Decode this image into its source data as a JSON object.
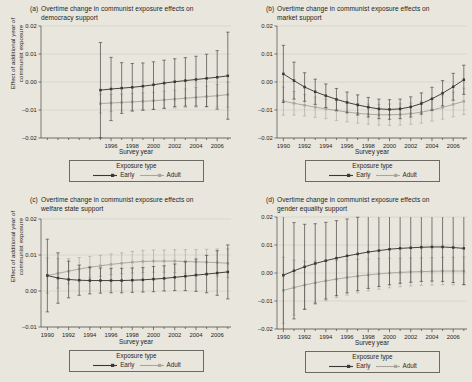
{
  "figure": {
    "background_color": "#e9e6dd",
    "series_colors": {
      "early": "#3a3834",
      "adult": "#a8a59c"
    },
    "axis_labels": {
      "x": "Survey year",
      "y_line1": "Effect of additional year of",
      "y_line2": "communist exposure"
    },
    "legend": {
      "title": "Exposure type",
      "entries": [
        {
          "label": "Early",
          "color": "#3a3834"
        },
        {
          "label": "Adult",
          "color": "#a8a59c"
        }
      ]
    }
  },
  "chart_data": [
    {
      "type": "line",
      "panel": "a",
      "panel_label": "(a)",
      "title_line1": "Overtime change in communist exposure effects on",
      "title_line2": "democracy support",
      "xlabel": "Survey year",
      "ylabel": "Effect of additional year of communist exposure",
      "xlim": [
        1989.4,
        2007.3
      ],
      "ylim": [
        -0.02,
        0.02
      ],
      "yticks": [
        0.02,
        0.01,
        0.0,
        -0.01,
        -0.02
      ],
      "yticklabels": [
        "0.02",
        "0.01",
        "0.00",
        "-0.01",
        "-0.02"
      ],
      "xticks": [
        1990,
        1991,
        1992,
        1993,
        1994,
        1995,
        1996,
        1997,
        1998,
        1999,
        2000,
        2001,
        2002,
        2003,
        2004,
        2005,
        2006,
        2007
      ],
      "xticklabels_major": [
        1996,
        1998,
        2000,
        2002,
        2004,
        2006
      ],
      "grid": "horizontal",
      "x": [
        1995,
        1996,
        1997,
        1998,
        1999,
        2000,
        2001,
        2002,
        2003,
        2004,
        2005,
        2006,
        2007
      ],
      "series": [
        {
          "name": "Early",
          "color": "#3a3834",
          "values": [
            -0.0029,
            -0.0025,
            -0.0022,
            -0.0019,
            -0.0015,
            -0.001,
            -0.0004,
            0.0001,
            0.0005,
            0.0009,
            0.0013,
            0.0017,
            0.0022
          ],
          "ci_low": [
            -0.0199,
            -0.0138,
            -0.0112,
            -0.0104,
            -0.0101,
            -0.0098,
            -0.0094,
            -0.0088,
            -0.0086,
            -0.0086,
            -0.0088,
            -0.0097,
            -0.0133
          ],
          "ci_high": [
            0.0141,
            0.0088,
            0.0069,
            0.0066,
            0.0068,
            0.0072,
            0.0078,
            0.0083,
            0.0087,
            0.0092,
            0.0099,
            0.0112,
            0.0178
          ]
        },
        {
          "name": "Adult",
          "color": "#a8a59c",
          "values": [
            -0.0077,
            -0.0075,
            -0.0073,
            -0.0071,
            -0.0069,
            -0.0067,
            -0.0064,
            -0.0061,
            -0.0058,
            -0.0055,
            -0.0052,
            -0.0049,
            -0.0045
          ],
          "ci_low": [
            -0.0111,
            -0.0106,
            -0.0103,
            -0.0101,
            -0.0099,
            -0.0097,
            -0.0095,
            -0.0093,
            -0.0091,
            -0.009,
            -0.0089,
            -0.0089,
            -0.009
          ],
          "ci_high": [
            -0.0043,
            -0.0044,
            -0.0043,
            -0.0041,
            -0.0039,
            -0.0037,
            -0.0033,
            -0.0029,
            -0.0025,
            -0.002,
            -0.0015,
            -0.0009,
            0.0
          ]
        }
      ]
    },
    {
      "type": "line",
      "panel": "b",
      "panel_label": "(b)",
      "title_line1": "Overtime change in communist exposure effects on",
      "title_line2": "market support",
      "xlabel": "Survey year",
      "ylabel": "Effect of additional year of communist exposure",
      "xlim": [
        1989.4,
        2007.3
      ],
      "ylim": [
        -0.02,
        0.02
      ],
      "yticks": [
        0.02,
        0.01,
        0.0,
        -0.01,
        -0.02
      ],
      "yticklabels": [
        "0.02",
        "0.01",
        "0.00",
        "-0.01",
        "-0.02"
      ],
      "xticks": [
        1990,
        1991,
        1992,
        1993,
        1994,
        1995,
        1996,
        1997,
        1998,
        1999,
        2000,
        2001,
        2002,
        2003,
        2004,
        2005,
        2006,
        2007
      ],
      "xticklabels_major": [
        1990,
        1992,
        1994,
        1996,
        1998,
        2000,
        2002,
        2004,
        2006
      ],
      "grid": "horizontal",
      "x": [
        1990,
        1991,
        1992,
        1993,
        1994,
        1995,
        1996,
        1997,
        1998,
        1999,
        2000,
        2001,
        2002,
        2003,
        2004,
        2005,
        2006,
        2007
      ],
      "series": [
        {
          "name": "Early",
          "color": "#3a3834",
          "values": [
            0.0029,
            0.0005,
            -0.0018,
            -0.0035,
            -0.0049,
            -0.0062,
            -0.0073,
            -0.0082,
            -0.009,
            -0.0096,
            -0.0098,
            -0.0096,
            -0.0089,
            -0.0077,
            -0.006,
            -0.004,
            -0.0017,
            0.0008
          ],
          "ci_low": [
            -0.0073,
            -0.0061,
            -0.0069,
            -0.008,
            -0.0091,
            -0.0101,
            -0.011,
            -0.0118,
            -0.0125,
            -0.0131,
            -0.0133,
            -0.0131,
            -0.0125,
            -0.0115,
            -0.0101,
            -0.0085,
            -0.0065,
            -0.0044
          ],
          "ci_high": [
            0.0131,
            0.0071,
            0.0033,
            0.001,
            -0.0007,
            -0.0023,
            -0.0036,
            -0.0046,
            -0.0055,
            -0.0061,
            -0.0063,
            -0.0061,
            -0.0053,
            -0.0039,
            -0.0019,
            0.0005,
            0.0031,
            0.006
          ]
        },
        {
          "name": "Adult",
          "color": "#a8a59c",
          "values": [
            -0.0068,
            -0.0076,
            -0.0083,
            -0.009,
            -0.0096,
            -0.0102,
            -0.0107,
            -0.0112,
            -0.0115,
            -0.0117,
            -0.0117,
            -0.0116,
            -0.0113,
            -0.0108,
            -0.01,
            -0.0091,
            -0.008,
            -0.0069
          ],
          "ci_low": [
            -0.0118,
            -0.0118,
            -0.0121,
            -0.0126,
            -0.0131,
            -0.0137,
            -0.0142,
            -0.0147,
            -0.0151,
            -0.0154,
            -0.0155,
            -0.0154,
            -0.0151,
            -0.0147,
            -0.014,
            -0.0133,
            -0.0124,
            -0.0116
          ],
          "ci_high": [
            -0.0018,
            -0.0034,
            -0.0045,
            -0.0054,
            -0.0061,
            -0.0067,
            -0.0072,
            -0.0077,
            -0.0079,
            -0.008,
            -0.0079,
            -0.0078,
            -0.0075,
            -0.0069,
            -0.006,
            -0.0049,
            -0.0036,
            -0.0022
          ]
        }
      ]
    },
    {
      "type": "line",
      "panel": "c",
      "panel_label": "(c)",
      "title_line1": "Overtime change in communist exposure effects on",
      "title_line2": "welfare state support",
      "xlabel": "Survey year",
      "ylabel": "Effect of additional year of communist exposure",
      "xlim": [
        1989.4,
        2007.3
      ],
      "ylim": [
        -0.01,
        0.02
      ],
      "yticks": [
        0.02,
        0.01,
        0.0,
        -0.01
      ],
      "yticklabels": [
        "0.02",
        "0.01",
        "0.00",
        "-0.01"
      ],
      "xticks": [
        1990,
        1991,
        1992,
        1993,
        1994,
        1995,
        1996,
        1997,
        1998,
        1999,
        2000,
        2001,
        2002,
        2003,
        2004,
        2005,
        2006,
        2007
      ],
      "xticklabels_major": [
        1990,
        1992,
        1994,
        1996,
        1998,
        2000,
        2002,
        2004,
        2006
      ],
      "grid": "horizontal",
      "x": [
        1990,
        1991,
        1992,
        1993,
        1994,
        1995,
        1996,
        1997,
        1998,
        1999,
        2000,
        2001,
        2002,
        2003,
        2004,
        2005,
        2006,
        2007
      ],
      "series": [
        {
          "name": "Early",
          "color": "#3a3834",
          "values": [
            0.0043,
            0.0036,
            0.0032,
            0.003,
            0.0029,
            0.0029,
            0.0029,
            0.0029,
            0.003,
            0.0031,
            0.0033,
            0.0035,
            0.0038,
            0.0041,
            0.0044,
            0.0047,
            0.005,
            0.0053
          ],
          "ci_low": [
            -0.0058,
            -0.0034,
            -0.0019,
            -0.0012,
            -0.0008,
            -0.0006,
            -0.0005,
            -0.0005,
            -0.0004,
            -0.0003,
            -0.0002,
            0.0,
            0.0001,
            0.0001,
            -0.0001,
            -0.0005,
            -0.0012,
            -0.0022
          ],
          "ci_high": [
            0.0144,
            0.0106,
            0.0083,
            0.0072,
            0.0066,
            0.0064,
            0.0063,
            0.0063,
            0.0064,
            0.0065,
            0.0068,
            0.007,
            0.0075,
            0.0081,
            0.0089,
            0.0099,
            0.0112,
            0.0128
          ]
        },
        {
          "name": "Adult",
          "color": "#a8a59c",
          "values": [
            0.0043,
            0.0049,
            0.0055,
            0.0061,
            0.0066,
            0.007,
            0.0074,
            0.0077,
            0.008,
            0.0082,
            0.0083,
            0.0083,
            0.0083,
            0.0082,
            0.0081,
            0.008,
            0.0079,
            0.0077
          ],
          "ci_low": [
            -0.0006,
            0.0008,
            0.002,
            0.0029,
            0.0036,
            0.0041,
            0.0045,
            0.0048,
            0.005,
            0.0051,
            0.0052,
            0.0052,
            0.0051,
            0.0049,
            0.0047,
            0.0044,
            0.0041,
            0.0037
          ],
          "ci_high": [
            0.0092,
            0.009,
            0.009,
            0.0093,
            0.0096,
            0.0099,
            0.0103,
            0.0106,
            0.011,
            0.0113,
            0.0114,
            0.0114,
            0.0115,
            0.0115,
            0.0115,
            0.0116,
            0.0117,
            0.0117
          ]
        }
      ]
    },
    {
      "type": "line",
      "panel": "d",
      "panel_label": "(d)",
      "title_line1": "Overtime change in communist exposure effects on",
      "title_line2": "gender equality support",
      "xlabel": "Survey year",
      "ylabel": "Effect of additional year of communist exposure",
      "xlim": [
        1989.4,
        2007.3
      ],
      "ylim": [
        -0.02,
        0.02
      ],
      "yticks": [
        0.02,
        0.01,
        0.0,
        -0.01,
        -0.02
      ],
      "yticklabels": [
        "0.02",
        "0.01",
        "0.00",
        "-0.01",
        "-0.02"
      ],
      "xticks": [
        1990,
        1991,
        1992,
        1993,
        1994,
        1995,
        1996,
        1997,
        1998,
        1999,
        2000,
        2001,
        2002,
        2003,
        2004,
        2005,
        2006,
        2007
      ],
      "xticklabels_major": [
        1990,
        1992,
        1994,
        1996,
        1998,
        2000,
        2002,
        2004,
        2006
      ],
      "grid": "horizontal",
      "x": [
        1990,
        1991,
        1992,
        1993,
        1994,
        1995,
        1996,
        1997,
        1998,
        1999,
        2000,
        2001,
        2002,
        2003,
        2004,
        2005,
        2006,
        2007
      ],
      "series": [
        {
          "name": "Early",
          "color": "#3a3834",
          "values": [
            -0.0008,
            0.0008,
            0.0022,
            0.0034,
            0.0044,
            0.0053,
            0.0061,
            0.0068,
            0.0075,
            0.008,
            0.0085,
            0.0088,
            0.009,
            0.0092,
            0.0093,
            0.0093,
            0.0091,
            0.0088
          ],
          "ci_low": [
            -0.0224,
            -0.0164,
            -0.013,
            -0.0108,
            -0.0093,
            -0.0081,
            -0.0071,
            -0.0063,
            -0.0055,
            -0.0048,
            -0.0042,
            -0.0037,
            -0.0033,
            -0.003,
            -0.0029,
            -0.003,
            -0.0034,
            -0.0041
          ],
          "ci_high": [
            0.0208,
            0.018,
            0.0174,
            0.0176,
            0.0181,
            0.0187,
            0.0193,
            0.0199,
            0.0205,
            0.0208,
            0.0212,
            0.0213,
            0.0213,
            0.0214,
            0.0215,
            0.0216,
            0.0216,
            0.0217
          ]
        },
        {
          "name": "Adult",
          "color": "#a8a59c",
          "values": [
            -0.0062,
            -0.0052,
            -0.0043,
            -0.0035,
            -0.0028,
            -0.0022,
            -0.0016,
            -0.0011,
            -0.0007,
            -0.0003,
            0.0,
            0.0002,
            0.0004,
            0.0005,
            0.0006,
            0.0007,
            0.0007,
            0.0007
          ],
          "ci_low": [
            -0.018,
            -0.015,
            -0.0128,
            -0.0112,
            -0.0099,
            -0.0088,
            -0.0079,
            -0.0071,
            -0.0064,
            -0.0058,
            -0.0053,
            -0.0049,
            -0.0046,
            -0.0044,
            -0.0043,
            -0.0042,
            -0.0042,
            -0.0043
          ],
          "ci_high": [
            0.0056,
            0.0046,
            0.0042,
            0.0042,
            0.0043,
            0.0044,
            0.0047,
            0.0049,
            0.005,
            0.0052,
            0.0053,
            0.0053,
            0.0054,
            0.0054,
            0.0055,
            0.0056,
            0.0056,
            0.0057
          ]
        }
      ]
    }
  ]
}
